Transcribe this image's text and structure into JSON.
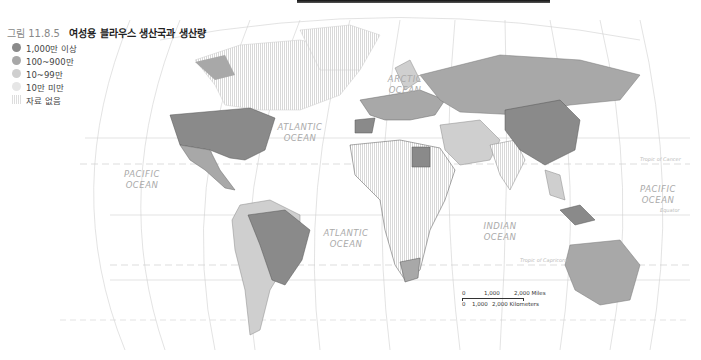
{
  "figure": {
    "number": "그림 11.8.5",
    "title": "여성용 블라우스 생산국과 생산량"
  },
  "legend": [
    {
      "label": "1,000만 이상",
      "color": "#8a8a8a",
      "style": "solid"
    },
    {
      "label": "100~900만",
      "color": "#a8a8a8",
      "style": "solid"
    },
    {
      "label": "10~99만",
      "color": "#cfcfcf",
      "style": "solid"
    },
    {
      "label": "10만 미만",
      "color": "#e6e6e6",
      "style": "solid"
    },
    {
      "label": "자료 없음",
      "color": "#dddddd",
      "style": "hatched"
    }
  ],
  "oceans": [
    {
      "name": "ARCTIC",
      "name2": "OCEAN",
      "x": 405,
      "y": 82
    },
    {
      "name": "ATLANTIC",
      "name2": "OCEAN",
      "x": 300,
      "y": 130
    },
    {
      "name": "PACIFIC",
      "name2": "OCEAN",
      "x": 142,
      "y": 177
    },
    {
      "name": "PACIFIC",
      "name2": "OCEAN",
      "x": 658,
      "y": 192
    },
    {
      "name": "ATLANTIC",
      "name2": "OCEAN",
      "x": 346,
      "y": 236
    },
    {
      "name": "INDIAN",
      "name2": "OCEAN",
      "x": 500,
      "y": 229
    }
  ],
  "lines": {
    "tropic_cancer": "Tropic of Cancer",
    "equator": "Equator",
    "tropic_capricorn": "Tropic of Capricorn"
  },
  "scale_bar": {
    "miles": [
      "0",
      "1,000",
      "2,000 Miles"
    ],
    "km": [
      "0",
      "1,000",
      "2,000 Kilometers"
    ]
  }
}
